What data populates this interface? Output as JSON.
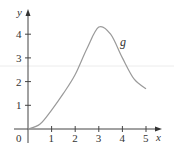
{
  "chart_data": {
    "type": "line",
    "title": "",
    "xlabel": "x",
    "ylabel": "y",
    "xlim": [
      0,
      5
    ],
    "ylim": [
      0,
      4.5
    ],
    "grid": false,
    "x_ticks": [
      1,
      2,
      3,
      4,
      5
    ],
    "y_ticks": [
      1,
      2,
      3,
      4
    ],
    "origin_label": "0",
    "series": [
      {
        "name": "g",
        "x": [
          0,
          0.5,
          1,
          1.5,
          2,
          2.5,
          3,
          3.5,
          4,
          4.5,
          5
        ],
        "values": [
          0,
          0.2,
          0.8,
          1.5,
          2.3,
          3.4,
          4.3,
          4.0,
          3.0,
          2.1,
          1.7
        ]
      }
    ],
    "annotations": [
      {
        "text": "g",
        "x": 4.0,
        "y": 3.6
      }
    ],
    "colors": {
      "curve": "#9a9a9a",
      "axes": "#444444",
      "text": "#333333"
    }
  }
}
